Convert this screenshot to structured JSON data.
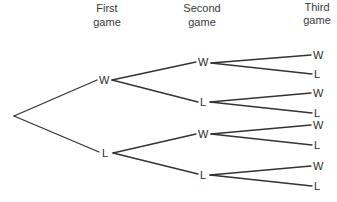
{
  "diagram": {
    "type": "tree-diagram",
    "headers": [
      {
        "line1": "First",
        "line2": "game"
      },
      {
        "line1": "Second",
        "line2": "game"
      },
      {
        "line1": "Third",
        "line2": "game"
      }
    ],
    "levels": {
      "first": [
        {
          "label": "W"
        },
        {
          "label": "L"
        }
      ],
      "second": [
        {
          "label": "W",
          "parent": "first.0"
        },
        {
          "label": "L",
          "parent": "first.0"
        },
        {
          "label": "W",
          "parent": "first.1"
        },
        {
          "label": "L",
          "parent": "first.1"
        }
      ],
      "third": [
        {
          "label": "W",
          "parent": "second.0"
        },
        {
          "label": "L",
          "parent": "second.0"
        },
        {
          "label": "W",
          "parent": "second.1"
        },
        {
          "label": "L",
          "parent": "second.1"
        },
        {
          "label": "W",
          "parent": "second.2"
        },
        {
          "label": "L",
          "parent": "second.2"
        },
        {
          "label": "W",
          "parent": "second.3"
        },
        {
          "label": "L",
          "parent": "second.3"
        }
      ]
    },
    "colors": {
      "line": "#333333",
      "text": "#2b2b2b",
      "background": "#ffffff"
    }
  }
}
